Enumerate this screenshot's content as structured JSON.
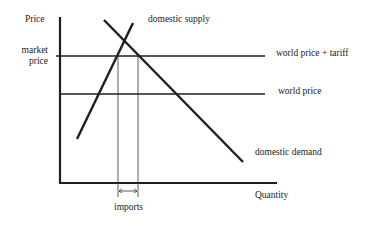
{
  "diagram": {
    "axes": {
      "y_label": "Price",
      "x_label": "Quantity"
    },
    "y_tick_label": {
      "line1": "market",
      "line2": "price"
    },
    "curves": {
      "supply": "domestic supply",
      "demand": "domestic demand"
    },
    "price_lines": {
      "tariff": "world price + tariff",
      "world": "world price"
    },
    "annotation": "imports",
    "colors": {
      "line": "#1e1e1e",
      "background": "#ffffff"
    }
  }
}
